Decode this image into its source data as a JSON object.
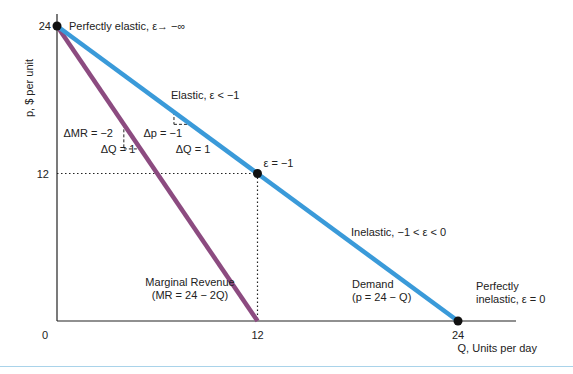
{
  "chart_data": {
    "type": "line",
    "title": "",
    "xlabel": "Q, Units per day",
    "ylabel": "p, $ per unit",
    "xlim": [
      0,
      24
    ],
    "ylim": [
      0,
      24
    ],
    "grid": false,
    "x_ticks": [
      "0",
      "12",
      "24"
    ],
    "y_ticks": [
      "24",
      "12"
    ],
    "series": [
      {
        "name": "Demand",
        "equation": "p = 24 - Q",
        "color": "#3a9ad9",
        "points": [
          [
            0,
            24
          ],
          [
            24,
            0
          ]
        ]
      },
      {
        "name": "Marginal Revenue",
        "equation": "MR = 24 - 2Q",
        "color": "#8c4b80",
        "points": [
          [
            0,
            24
          ],
          [
            12,
            0
          ]
        ]
      }
    ],
    "marked_points": [
      {
        "x": 0,
        "y": 24,
        "label": "Perfectly elastic, ε→ −∞"
      },
      {
        "x": 12,
        "y": 12,
        "label": "ε = −1"
      },
      {
        "x": 24,
        "y": 0,
        "label_line1": "Perfectly",
        "label_line2": "inelastic, ε = 0"
      }
    ],
    "guides": [
      {
        "from": [
          0,
          12
        ],
        "to": [
          12,
          12
        ],
        "style": "dotted"
      },
      {
        "from": [
          12,
          12
        ],
        "to": [
          12,
          0
        ],
        "style": "dotted"
      }
    ],
    "annotations": {
      "elastic": "Elastic, ε < −1",
      "inelastic": "Inelastic, −1 < ε < 0",
      "demand_line1": "Demand",
      "demand_line2": "(p = 24 − Q)",
      "mr_line1": "Marginal Revenue",
      "mr_line2": "(MR = 24 − 2Q)",
      "delta_mr": "ΔMR = −2",
      "delta_q_mr": "ΔQ = 1",
      "delta_p": "Δp = −1",
      "delta_q_demand": "ΔQ = 1"
    },
    "slope_triangles": [
      {
        "series": "Marginal Revenue",
        "start": [
          4,
          16
        ],
        "dq": 1,
        "dy": -2
      },
      {
        "series": "Demand",
        "start": [
          7,
          17
        ],
        "dq": 1,
        "dy": -1
      }
    ]
  }
}
